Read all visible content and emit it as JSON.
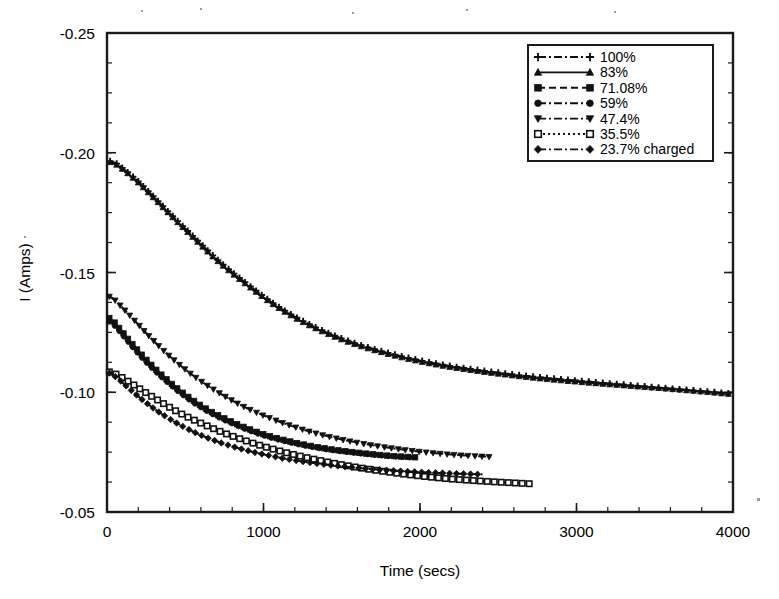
{
  "figure": {
    "background": "#ffffff",
    "ink_color": "#111111"
  },
  "chart_data": {
    "type": "line",
    "title": "",
    "xlabel": "Time (secs)",
    "ylabel": "I (Amps)",
    "xlim": [
      0,
      4000
    ],
    "ylim": [
      -0.25,
      -0.05
    ],
    "y_inverted_axis": true,
    "grid": false,
    "legend_position": "top-right",
    "xticks": [
      0,
      1000,
      2000,
      3000,
      4000
    ],
    "xtick_labels": [
      "0",
      "1000",
      "2000",
      "3000",
      "4000"
    ],
    "xticks_minor_step": 200,
    "yticks": [
      -0.25,
      -0.2,
      -0.15,
      -0.1,
      -0.05
    ],
    "ytick_labels": [
      "-0.25",
      "-0.20",
      "-0.15",
      "-0.10",
      "-0.05"
    ],
    "yticks_minor_step": 0.0125,
    "series": [
      {
        "name": "100%",
        "marker": "plus",
        "linestyle": "dash-dot",
        "x": [
          20,
          60,
          120,
          200,
          300,
          420,
          560,
          720,
          900,
          1100,
          1320,
          1560,
          1820,
          2100,
          2400,
          2720,
          3060,
          3420,
          3700,
          3980
        ],
        "y": [
          -0.1965,
          -0.1955,
          -0.1925,
          -0.188,
          -0.1815,
          -0.1735,
          -0.1645,
          -0.1545,
          -0.145,
          -0.1355,
          -0.1275,
          -0.121,
          -0.116,
          -0.112,
          -0.109,
          -0.1065,
          -0.1045,
          -0.1025,
          -0.101,
          -0.0995
        ]
      },
      {
        "name": "83%",
        "marker": "triangle-up",
        "linestyle": "solid",
        "x": [
          20,
          60,
          120,
          200,
          300,
          420,
          560,
          720,
          900,
          1100,
          1320,
          1560,
          1820,
          2100,
          2400,
          2720,
          3060,
          3420,
          3700,
          3980
        ],
        "y": [
          -0.196,
          -0.195,
          -0.192,
          -0.1875,
          -0.181,
          -0.173,
          -0.164,
          -0.154,
          -0.1445,
          -0.135,
          -0.127,
          -0.1205,
          -0.1155,
          -0.1115,
          -0.1085,
          -0.106,
          -0.104,
          -0.1022,
          -0.1008,
          -0.0992
        ]
      },
      {
        "name": "71.08%",
        "marker": "square-filled",
        "linestyle": "dashed",
        "x": [
          15,
          50,
          100,
          170,
          260,
          370,
          500,
          650,
          820,
          1000,
          1200,
          1400,
          1600,
          1800,
          1980
        ],
        "y": [
          -0.131,
          -0.129,
          -0.125,
          -0.1195,
          -0.113,
          -0.106,
          -0.099,
          -0.0925,
          -0.087,
          -0.0825,
          -0.079,
          -0.0765,
          -0.0748,
          -0.0735,
          -0.0728
        ]
      },
      {
        "name": "59%",
        "marker": "circle",
        "linestyle": "dash-dot",
        "x": [
          15,
          50,
          100,
          170,
          260,
          370,
          500,
          650,
          820,
          1000,
          1200,
          1400,
          1600,
          1800,
          1975
        ],
        "y": [
          -0.1295,
          -0.1278,
          -0.124,
          -0.1185,
          -0.112,
          -0.1052,
          -0.0982,
          -0.0918,
          -0.0864,
          -0.082,
          -0.0786,
          -0.0762,
          -0.0746,
          -0.0734,
          -0.0727
        ]
      },
      {
        "name": "47.4%",
        "marker": "triangle-down",
        "linestyle": "dash-dot",
        "x": [
          15,
          50,
          110,
          190,
          290,
          410,
          550,
          710,
          890,
          1090,
          1300,
          1520,
          1760,
          2000,
          2240,
          2460
        ],
        "y": [
          -0.14,
          -0.1385,
          -0.1345,
          -0.129,
          -0.122,
          -0.1145,
          -0.107,
          -0.1,
          -0.0935,
          -0.088,
          -0.0835,
          -0.08,
          -0.0772,
          -0.0752,
          -0.0738,
          -0.073
        ]
      },
      {
        "name": "35.5%",
        "marker": "square-open",
        "linestyle": "dotted",
        "x": [
          15,
          60,
          130,
          220,
          330,
          460,
          610,
          780,
          970,
          1180,
          1400,
          1640,
          1900,
          2160,
          2420,
          2700
        ],
        "y": [
          -0.1085,
          -0.1075,
          -0.1048,
          -0.101,
          -0.0965,
          -0.0915,
          -0.0868,
          -0.0822,
          -0.078,
          -0.0742,
          -0.071,
          -0.0682,
          -0.0658,
          -0.064,
          -0.0628,
          -0.0618
        ]
      },
      {
        "name": "23.7% charged",
        "marker": "diamond",
        "linestyle": "dash-dot",
        "x": [
          15,
          60,
          130,
          220,
          330,
          460,
          610,
          780,
          970,
          1180,
          1400,
          1640,
          1900,
          2160,
          2400
        ],
        "y": [
          -0.108,
          -0.1062,
          -0.1022,
          -0.0972,
          -0.0918,
          -0.0866,
          -0.0818,
          -0.0778,
          -0.0745,
          -0.0718,
          -0.0698,
          -0.0682,
          -0.067,
          -0.0662,
          -0.0657
        ]
      }
    ]
  },
  "legend": {
    "items": [
      {
        "label": "100%",
        "marker": "plus-icon"
      },
      {
        "label": "83%",
        "marker": "triangle-up-icon"
      },
      {
        "label": "71.08%",
        "marker": "square-filled-icon"
      },
      {
        "label": "59%",
        "marker": "circle-icon"
      },
      {
        "label": "47.4%",
        "marker": "triangle-down-icon"
      },
      {
        "label": "35.5%",
        "marker": "square-open-icon"
      },
      {
        "label": "23.7% charged",
        "marker": "diamond-icon"
      }
    ]
  }
}
